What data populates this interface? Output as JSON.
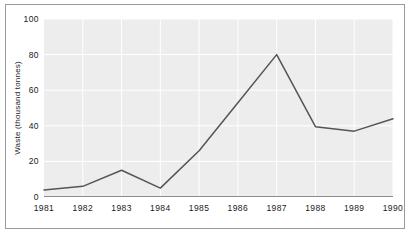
{
  "chart_data": {
    "type": "line",
    "title": "",
    "subtitle": "",
    "xlabel": "",
    "ylabel": "Waste (thousand tonnes)",
    "categories": [
      "1981",
      "1982",
      "1983",
      "1984",
      "1985",
      "1986",
      "1987",
      "1988",
      "1989",
      "1990"
    ],
    "x": [
      1981,
      1982,
      1983,
      1984,
      1985,
      1986,
      1987,
      1988,
      1989,
      1990
    ],
    "values": [
      4,
      6,
      15,
      5,
      26,
      53,
      80,
      39.5,
      37,
      44
    ],
    "series": [
      {
        "name": "Waste",
        "values": [
          4,
          6,
          15,
          5,
          26,
          53,
          80,
          39.5,
          37,
          44
        ]
      }
    ],
    "ylim": [
      0,
      100
    ],
    "yticks": [
      0,
      20,
      40,
      60,
      80,
      100
    ],
    "ytick_labels": [
      "0",
      "20",
      "40",
      "60",
      "80",
      "100"
    ],
    "xtick_labels": [
      "1981",
      "1982",
      "1983",
      "1984",
      "1985",
      "1986",
      "1987",
      "1988",
      "1989",
      "1990"
    ],
    "grid": true,
    "grid_color": "#ffffff",
    "legend": false,
    "legend_position": "none",
    "markers": false,
    "line_color": "#555555",
    "plot_background": "#ededed",
    "figure_background": "#ffffff",
    "frame_color": "#9a9a9a",
    "axis_color": "#8c8c8c",
    "text_color": "#1a1a1a"
  }
}
